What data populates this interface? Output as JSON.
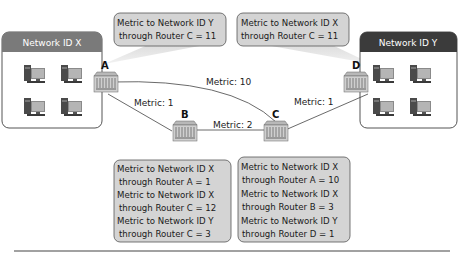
{
  "networks": {
    "x": {
      "label": "Network ID X",
      "header_color": "#7a7a7a"
    },
    "y": {
      "label": "Network ID Y",
      "header_color": "#3b3b3b"
    }
  },
  "routers": {
    "a": {
      "label": "A"
    },
    "b": {
      "label": "B"
    },
    "c": {
      "label": "C"
    },
    "d": {
      "label": "D"
    }
  },
  "links": {
    "a_c": "Metric: 10",
    "a_b": "Metric: 1",
    "b_c": "Metric: 2",
    "c_d": "Metric: 1"
  },
  "bubbles": {
    "a": [
      "Metric to Network ID Y",
      "through Router C = 11"
    ],
    "d": [
      "Metric to Network ID X",
      "through Router C = 11"
    ],
    "b": [
      "Metric to Network ID X",
      "through Router A = 1",
      "Metric to Network ID X",
      "through Router C = 12",
      "Metric to Network ID Y",
      "through Router C = 3"
    ],
    "c": [
      "Metric to Network ID X",
      "through Router A = 10",
      "Metric to Network ID X",
      "through Router B = 3",
      "Metric to Network ID Y",
      "through Router D = 1"
    ]
  },
  "colors": {
    "bubble_fill": "#d4d4d4",
    "bubble_stroke": "#555555",
    "cone_fill": "#e6e6e6",
    "router_fill": "#c9c9c9",
    "line": "#444444"
  }
}
